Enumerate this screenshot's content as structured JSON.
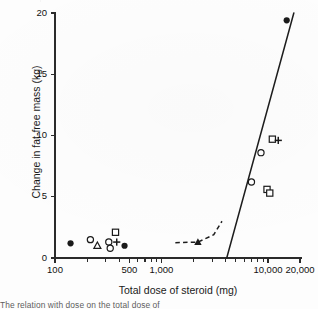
{
  "figure": {
    "caption_cropped": "The relation with dose on the total dose of"
  },
  "chart_data": {
    "type": "scatter",
    "title": "",
    "xlabel": "Total dose of steroid (mg)",
    "ylabel": "Change in fat-free mass (kg)",
    "xscale": "log",
    "yscale": "linear",
    "xlim": [
      100,
      20000
    ],
    "ylim": [
      0,
      20
    ],
    "grid": false,
    "legend": "none",
    "xticks_labeled": [
      {
        "value": 100,
        "label": "100"
      },
      {
        "value": 500,
        "label": "500"
      },
      {
        "value": 1000,
        "label": "1,000"
      },
      {
        "value": 10000,
        "label": "10,000"
      },
      {
        "value": 20000,
        "label": "20,000"
      }
    ],
    "xticks_minor": [
      200,
      300,
      400,
      600,
      700,
      800,
      900,
      2000,
      3000,
      4000,
      5000,
      6000,
      7000,
      8000,
      9000
    ],
    "yticks": [
      0,
      5,
      10,
      15,
      20
    ],
    "series": [
      {
        "name": "filled-circle",
        "marker": "filled-circle",
        "points": [
          {
            "x": 140,
            "y": 1.2
          },
          {
            "x": 450,
            "y": 1.0
          },
          {
            "x": 15000,
            "y": 19.4
          }
        ]
      },
      {
        "name": "open-circle",
        "marker": "open-circle",
        "points": [
          {
            "x": 215,
            "y": 1.5
          },
          {
            "x": 320,
            "y": 1.3
          },
          {
            "x": 330,
            "y": 0.8
          },
          {
            "x": 7000,
            "y": 6.2
          },
          {
            "x": 8600,
            "y": 8.6
          }
        ]
      },
      {
        "name": "open-triangle",
        "marker": "open-triangle",
        "points": [
          {
            "x": 250,
            "y": 1.0
          }
        ]
      },
      {
        "name": "open-square",
        "marker": "open-square",
        "points": [
          {
            "x": 370,
            "y": 2.1
          },
          {
            "x": 9800,
            "y": 5.6
          },
          {
            "x": 10400,
            "y": 5.3
          },
          {
            "x": 11000,
            "y": 9.7
          }
        ]
      },
      {
        "name": "plus",
        "marker": "plus",
        "points": [
          {
            "x": 380,
            "y": 1.3
          },
          {
            "x": 12500,
            "y": 9.6
          }
        ]
      },
      {
        "name": "filled-triangle",
        "marker": "filled-triangle",
        "points": [
          {
            "x": 2200,
            "y": 1.3
          }
        ]
      }
    ],
    "annotations": [
      {
        "name": "regression-line",
        "style": "solid",
        "from": {
          "x": 4100,
          "y": 0.0
        },
        "to": {
          "x": 17500,
          "y": 20.0
        }
      },
      {
        "name": "dashed-trend-curve",
        "style": "dashed",
        "points": [
          {
            "x": 1350,
            "y": 1.25
          },
          {
            "x": 2200,
            "y": 1.3
          },
          {
            "x": 3100,
            "y": 1.9
          },
          {
            "x": 3700,
            "y": 3.0
          }
        ]
      }
    ]
  }
}
